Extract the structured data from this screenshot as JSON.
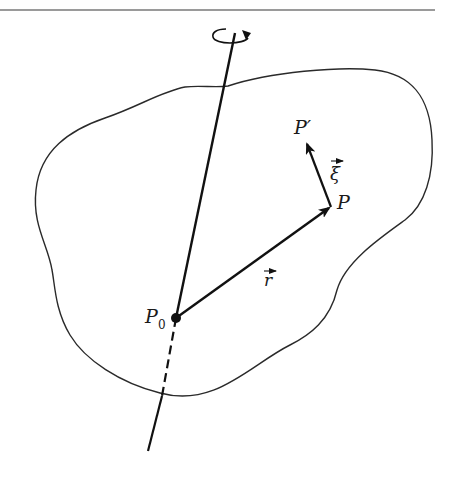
{
  "figure": {
    "type": "rigid body rotation diagram",
    "labels": {
      "p_prime": "P′",
      "xi": "ξ",
      "p": "P",
      "r": "r",
      "p0_main": "P",
      "p0_sub": "0"
    },
    "colors": {
      "stroke": "#111111",
      "outline": "#2a2a2a",
      "rule": "#9a9a9a",
      "background": "#ffffff"
    },
    "points": {
      "P0": [
        176,
        318
      ],
      "P": [
        331,
        207
      ],
      "P_prime": [
        304,
        140
      ],
      "axis_top": [
        235,
        33
      ],
      "axis_bottom": [
        148,
        451
      ]
    }
  }
}
